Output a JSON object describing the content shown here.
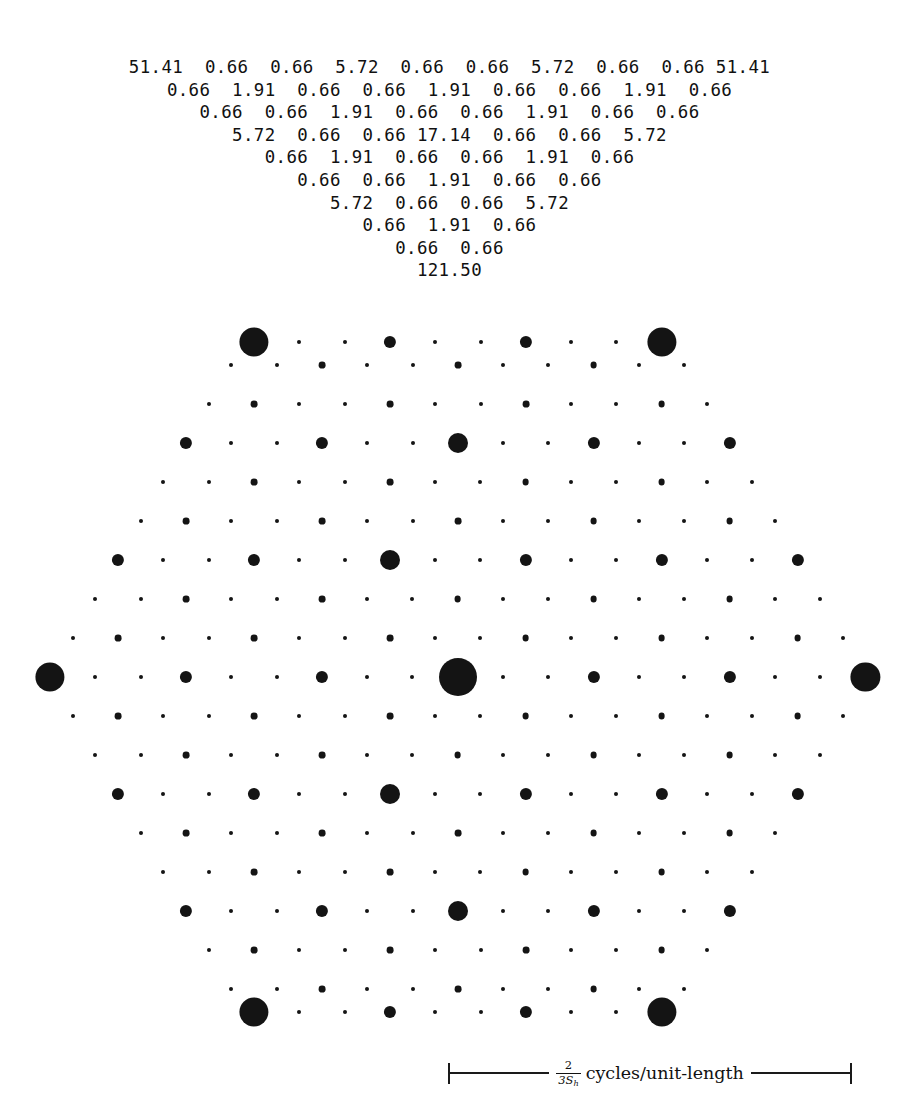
{
  "figure": {
    "type": "hexagonal-diffraction-spectrum",
    "background_color": "#ffffff",
    "dot_color": "#141414"
  },
  "value_table": {
    "rows": [
      "51.41  0.66  0.66  5.72  0.66  0.66  5.72  0.66  0.66 51.41",
      "0.66  1.91  0.66  0.66  1.91  0.66  0.66  1.91  0.66",
      "0.66  0.66  1.91  0.66  0.66  1.91  0.66  0.66",
      "5.72  0.66  0.66 17.14  0.66  0.66  5.72",
      "0.66  1.91  0.66  0.66  1.91  0.66",
      "0.66  0.66  1.91  0.66  0.66",
      "5.72  0.66  0.66  5.72",
      "0.66  1.91  0.66",
      "0.66  0.66",
      "121.50"
    ],
    "unique_values": [
      "0.66",
      "1.91",
      "5.72",
      "17.14",
      "51.41",
      "121.50"
    ]
  },
  "scale_bar": {
    "numerator": "2",
    "denominator": "3S",
    "denominator_subscript": "h",
    "units": "cycles/unit-length"
  },
  "chart_data": {
    "type": "scatter",
    "title": "",
    "xlabel": "",
    "ylabel": "",
    "grid": false,
    "legend": null,
    "note": "Dot area encodes spectral magnitude; lattice is hexagonal and mirror-symmetric about the centre row.",
    "magnitude_levels": [
      0.66,
      1.91,
      5.72,
      17.14,
      51.41,
      121.5
    ],
    "radius_px": [
      2.0,
      3.4,
      6.1,
      10.0,
      14.6,
      19.0
    ],
    "lattice": {
      "dx": 45.3,
      "dy": 39.2,
      "center_x": 450,
      "center_y": 677,
      "rows": 17
    },
    "rows": [
      {
        "y": 677,
        "x_start": 50,
        "values": [
          51.41,
          0.66,
          0.66,
          5.72,
          0.66,
          0.66,
          5.72,
          0.66,
          0.66,
          121.5,
          0.66,
          0.66,
          5.72,
          0.66,
          0.66,
          5.72,
          0.66,
          0.66,
          51.41
        ]
      },
      {
        "y": 638,
        "x_start": 72.7,
        "values": [
          0.66,
          1.91,
          0.66,
          0.66,
          1.91,
          0.66,
          0.66,
          1.91,
          0.66,
          0.66,
          1.91,
          0.66,
          0.66,
          1.91,
          0.66,
          0.66,
          1.91,
          0.66
        ]
      },
      {
        "y": 716,
        "x_start": 72.7,
        "values": [
          0.66,
          1.91,
          0.66,
          0.66,
          1.91,
          0.66,
          0.66,
          1.91,
          0.66,
          0.66,
          1.91,
          0.66,
          0.66,
          1.91,
          0.66,
          0.66,
          1.91,
          0.66
        ]
      },
      {
        "y": 599,
        "x_start": 95.3,
        "values": [
          0.66,
          0.66,
          1.91,
          0.66,
          0.66,
          1.91,
          0.66,
          0.66,
          1.91,
          0.66,
          0.66,
          1.91,
          0.66,
          0.66,
          1.91,
          0.66,
          0.66
        ]
      },
      {
        "y": 755,
        "x_start": 95.3,
        "values": [
          0.66,
          0.66,
          1.91,
          0.66,
          0.66,
          1.91,
          0.66,
          0.66,
          1.91,
          0.66,
          0.66,
          1.91,
          0.66,
          0.66,
          1.91,
          0.66,
          0.66
        ]
      },
      {
        "y": 560,
        "x_start": 118,
        "values": [
          5.72,
          0.66,
          0.66,
          5.72,
          0.66,
          0.66,
          17.14,
          0.66,
          0.66,
          5.72,
          0.66,
          0.66,
          5.72,
          0.66,
          0.66,
          5.72
        ]
      },
      {
        "y": 794,
        "x_start": 118,
        "values": [
          5.72,
          0.66,
          0.66,
          5.72,
          0.66,
          0.66,
          17.14,
          0.66,
          0.66,
          5.72,
          0.66,
          0.66,
          5.72,
          0.66,
          0.66,
          5.72
        ]
      },
      {
        "y": 521,
        "x_start": 140.7,
        "values": [
          0.66,
          1.91,
          0.66,
          0.66,
          1.91,
          0.66,
          0.66,
          1.91,
          0.66,
          0.66,
          1.91,
          0.66,
          0.66,
          1.91,
          0.66
        ]
      },
      {
        "y": 833,
        "x_start": 140.7,
        "values": [
          0.66,
          1.91,
          0.66,
          0.66,
          1.91,
          0.66,
          0.66,
          1.91,
          0.66,
          0.66,
          1.91,
          0.66,
          0.66,
          1.91,
          0.66
        ]
      },
      {
        "y": 482,
        "x_start": 163.3,
        "values": [
          0.66,
          0.66,
          1.91,
          0.66,
          0.66,
          1.91,
          0.66,
          0.66,
          1.91,
          0.66,
          0.66,
          1.91,
          0.66,
          0.66
        ]
      },
      {
        "y": 872,
        "x_start": 163.3,
        "values": [
          0.66,
          0.66,
          1.91,
          0.66,
          0.66,
          1.91,
          0.66,
          0.66,
          1.91,
          0.66,
          0.66,
          1.91,
          0.66,
          0.66
        ]
      },
      {
        "y": 443,
        "x_start": 186,
        "values": [
          5.72,
          0.66,
          0.66,
          5.72,
          0.66,
          0.66,
          17.14,
          0.66,
          0.66,
          5.72,
          0.66,
          0.66,
          5.72
        ]
      },
      {
        "y": 911,
        "x_start": 186,
        "values": [
          5.72,
          0.66,
          0.66,
          5.72,
          0.66,
          0.66,
          17.14,
          0.66,
          0.66,
          5.72,
          0.66,
          0.66,
          5.72
        ]
      },
      {
        "y": 404,
        "x_start": 208.7,
        "values": [
          0.66,
          1.91,
          0.66,
          0.66,
          1.91,
          0.66,
          0.66,
          1.91,
          0.66,
          0.66,
          1.91,
          0.66
        ]
      },
      {
        "y": 950,
        "x_start": 208.7,
        "values": [
          0.66,
          1.91,
          0.66,
          0.66,
          1.91,
          0.66,
          0.66,
          1.91,
          0.66,
          0.66,
          1.91,
          0.66
        ]
      },
      {
        "y": 365,
        "x_start": 231.3,
        "values": [
          0.66,
          0.66,
          1.91,
          0.66,
          0.66,
          1.91,
          0.66,
          0.66,
          1.91,
          0.66,
          0.66
        ]
      },
      {
        "y": 989,
        "x_start": 231.3,
        "values": [
          0.66,
          0.66,
          1.91,
          0.66,
          0.66,
          1.91,
          0.66,
          0.66,
          1.91,
          0.66,
          0.66
        ]
      },
      {
        "y": 342,
        "x_start": 254,
        "values": [
          51.41,
          0.66,
          0.66,
          5.72,
          0.66,
          0.66,
          5.72,
          0.66,
          0.66,
          51.41
        ]
      },
      {
        "y": 1012,
        "x_start": 254,
        "values": [
          51.41,
          0.66,
          0.66,
          5.72,
          0.66,
          0.66,
          5.72,
          0.66,
          0.66,
          51.41
        ]
      }
    ]
  }
}
